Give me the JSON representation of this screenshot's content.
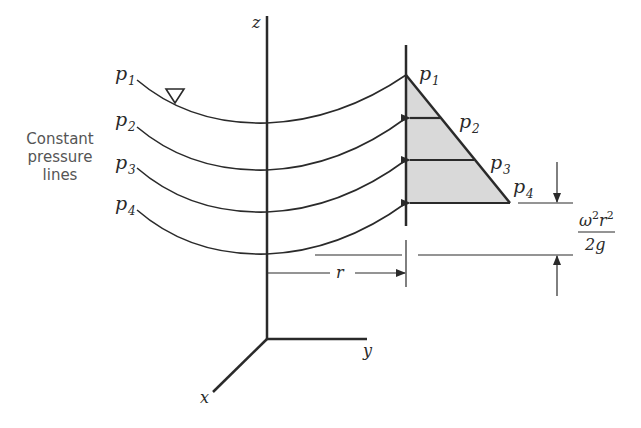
{
  "diagram": {
    "side_label": {
      "lines": [
        "Constant",
        "pressure",
        "lines"
      ]
    },
    "axes": {
      "z": "z",
      "y": "y",
      "x": "x"
    },
    "pressure_lines_left": [
      {
        "label": "p",
        "sub": "1"
      },
      {
        "label": "p",
        "sub": "2"
      },
      {
        "label": "p",
        "sub": "3"
      },
      {
        "label": "p",
        "sub": "4"
      }
    ],
    "pressure_labels_right": [
      {
        "label": "p",
        "sub": "1"
      },
      {
        "label": "p",
        "sub": "2"
      },
      {
        "label": "p",
        "sub": "3"
      },
      {
        "label": "p",
        "sub": "4"
      }
    ],
    "free_surface_symbol": "▽",
    "radius_label": "r",
    "height_formula": {
      "numerator": "ω²r²",
      "numerator_base1": "ω",
      "numerator_sup1": "2",
      "numerator_base2": "r",
      "numerator_sup2": "2",
      "denominator": "2g"
    },
    "colors": {
      "line": "#2a2a2a",
      "fill": "#d9d9d9",
      "label_text": "#555555"
    }
  }
}
